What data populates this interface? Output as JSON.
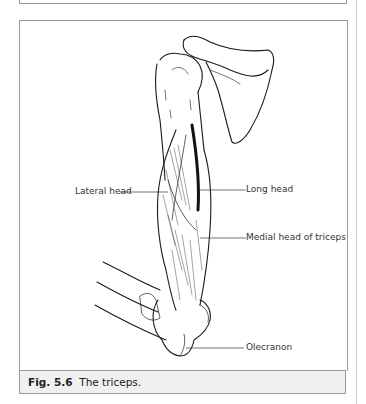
{
  "figure": {
    "number": "Fig. 5.6",
    "caption": "The triceps.",
    "labels": {
      "lateral_head": "Lateral head",
      "long_head": "Long head",
      "medial_head": "Medial head of triceps",
      "olecranon": "Olecranon"
    }
  }
}
